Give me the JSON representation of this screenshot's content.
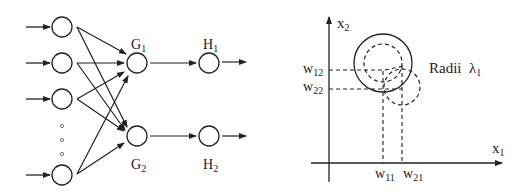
{
  "network": {
    "hidden_labels": [
      {
        "base": "G",
        "sub": "1"
      },
      {
        "base": "G",
        "sub": "2"
      }
    ],
    "output_labels": [
      {
        "base": "H",
        "sub": "1"
      },
      {
        "base": "H",
        "sub": "2"
      }
    ],
    "input_count_visible": 4,
    "ellipsis": "○ ○ ○"
  },
  "plot": {
    "x_axis_label": {
      "base": "x",
      "sub": "1"
    },
    "y_axis_label": {
      "base": "x",
      "sub": "2"
    },
    "y_ticks": [
      {
        "base": "w",
        "sub": "12"
      },
      {
        "base": "w",
        "sub": "22"
      }
    ],
    "x_ticks": [
      {
        "base": "w",
        "sub": "11"
      },
      {
        "base": "w",
        "sub": "21"
      }
    ],
    "annotation": {
      "text": "Radii",
      "symbol": "λ",
      "sub": "1"
    }
  },
  "colors": {
    "stroke": "#222222",
    "background": "#ffffff"
  }
}
